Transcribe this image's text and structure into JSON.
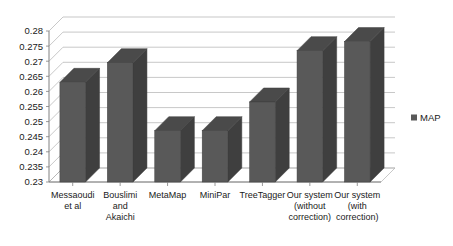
{
  "chart_data": {
    "type": "bar",
    "title": "",
    "subtitle": "",
    "xlabel": "",
    "ylabel": "",
    "ylim": [
      0.23,
      0.28
    ],
    "ytick_step": 0.005,
    "yticks": [
      "0.23",
      "0.235",
      "0.24",
      "0.245",
      "0.25",
      "0.255",
      "0.26",
      "0.265",
      "0.27",
      "0.275",
      "0.28"
    ],
    "grid": true,
    "three_d": true,
    "legend_position": "right",
    "categories": [
      "Messaoudi et al",
      "Bouslimi and Akaichi",
      "MetaMap",
      "MiniPar",
      "TreeTagger",
      "Our system (without correction)",
      "Our system (with correction)"
    ],
    "category_lines": [
      [
        "Messaoudi",
        "et al"
      ],
      [
        "Bouslimi",
        "and",
        "Akaichi"
      ],
      [
        "MetaMap"
      ],
      [
        "MiniPar"
      ],
      [
        "TreeTagger"
      ],
      [
        "Our system",
        "(without",
        "correction)"
      ],
      [
        "Our system",
        "(with",
        "correction)"
      ]
    ],
    "series": [
      {
        "name": "MAP",
        "values": [
          0.263,
          0.2695,
          0.247,
          0.247,
          0.2565,
          0.2735,
          0.2765
        ]
      }
    ],
    "colors": {
      "bar_front": "#595959",
      "bar_side": "#3f3f3f",
      "bar_top": "#4a4a4a",
      "gridline": "#b0b0b0",
      "axis": "#808080",
      "wall": "#ffffff",
      "background": "#ffffff",
      "text": "#1a1a1a"
    }
  },
  "legend": {
    "marker_name": "legend-swatch",
    "entries": [
      {
        "label": "MAP",
        "color": "#595959"
      }
    ]
  }
}
